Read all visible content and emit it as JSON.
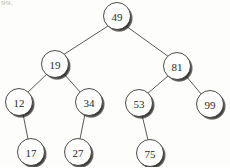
{
  "figure": {
    "kind": "binary-search-tree-diagram",
    "caption_fragment": "99.",
    "width": 230,
    "height": 167,
    "background_color": "#fdfdfc",
    "node_fill_color": "#ffffff",
    "node_stroke_color": "#3a3632",
    "node_shadow_color": "#262322",
    "edge_color": "#4a4540",
    "label_color": "#2a2724",
    "node_radius": 13.5,
    "label_font_size": 11
  },
  "tree": {
    "root_value": "49",
    "nodes": [
      {
        "id": "n49",
        "value": "49",
        "cx": 117,
        "cy": 16,
        "level": 0
      },
      {
        "id": "n19",
        "value": "19",
        "cx": 55,
        "cy": 64,
        "level": 1
      },
      {
        "id": "n81",
        "value": "81",
        "cx": 177,
        "cy": 66,
        "level": 1
      },
      {
        "id": "n12",
        "value": "12",
        "cx": 19,
        "cy": 102,
        "level": 2
      },
      {
        "id": "n34",
        "value": "34",
        "cx": 89,
        "cy": 102,
        "level": 2
      },
      {
        "id": "n53",
        "value": "53",
        "cx": 139,
        "cy": 103,
        "level": 2
      },
      {
        "id": "n99",
        "value": "99",
        "cx": 210,
        "cy": 104,
        "level": 2
      },
      {
        "id": "n17",
        "value": "17",
        "cx": 31,
        "cy": 152,
        "level": 3
      },
      {
        "id": "n27",
        "value": "27",
        "cx": 78,
        "cy": 152,
        "level": 3
      },
      {
        "id": "n75",
        "value": "75",
        "cx": 150,
        "cy": 153,
        "level": 3
      }
    ],
    "edges": [
      {
        "id": "e49-19",
        "from": "n49",
        "to": "n19",
        "side": "left",
        "x1": 108,
        "y1": 26,
        "x2": 63,
        "y2": 55
      },
      {
        "id": "e49-81",
        "from": "n49",
        "to": "n81",
        "side": "right",
        "x1": 126,
        "y1": 26,
        "x2": 169,
        "y2": 57
      },
      {
        "id": "e19-12",
        "from": "n19",
        "to": "n12",
        "side": "left",
        "x1": 47,
        "y1": 74,
        "x2": 27,
        "y2": 93
      },
      {
        "id": "e19-34",
        "from": "n19",
        "to": "n34",
        "side": "right",
        "x1": 64,
        "y1": 74,
        "x2": 81,
        "y2": 93
      },
      {
        "id": "e81-53",
        "from": "n81",
        "to": "n53",
        "side": "left",
        "x1": 168,
        "y1": 76,
        "x2": 147,
        "y2": 94
      },
      {
        "id": "e81-99",
        "from": "n81",
        "to": "n99",
        "side": "right",
        "x1": 186,
        "y1": 76,
        "x2": 202,
        "y2": 95
      },
      {
        "id": "e12-17",
        "from": "n12",
        "to": "n17",
        "side": "right",
        "x1": 23,
        "y1": 114,
        "x2": 28,
        "y2": 139
      },
      {
        "id": "e34-27",
        "from": "n34",
        "to": "n27",
        "side": "left",
        "x1": 85,
        "y1": 114,
        "x2": 80,
        "y2": 139
      },
      {
        "id": "e53-75",
        "from": "n53",
        "to": "n75",
        "side": "right",
        "x1": 142,
        "y1": 115,
        "x2": 148,
        "y2": 140
      }
    ]
  }
}
